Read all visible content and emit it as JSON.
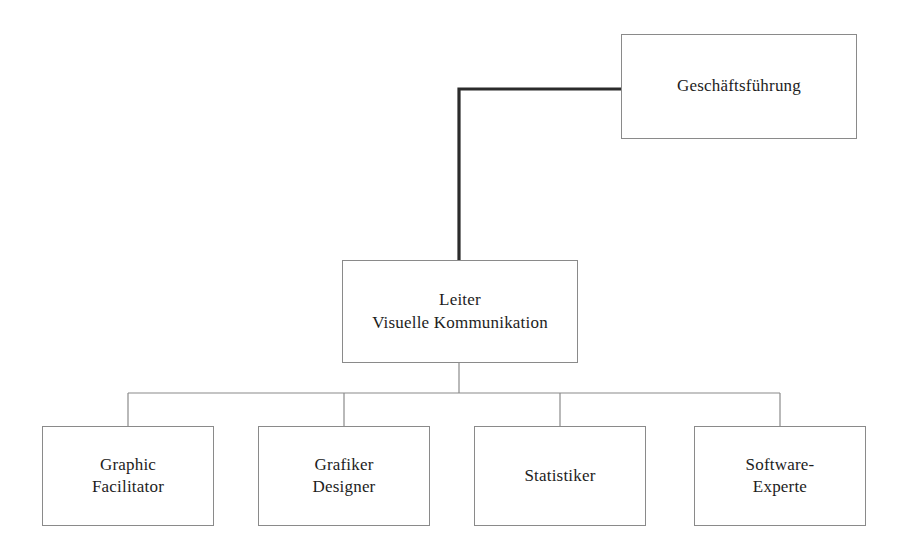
{
  "diagram": {
    "background_color": "#ffffff",
    "box_border_color": "#8a8a8a",
    "text_color": "#1d1d1d",
    "primary_edge_color": "#2b2b2b",
    "secondary_edge_color": "#8a8a8a",
    "nodes": {
      "executive": {
        "label": "Geschäftsführung",
        "level": 1
      },
      "head": {
        "label": "Leiter\nVisuelle Kommunikation",
        "line1": "Leiter",
        "line2": "Visuelle Kommunikation",
        "level": 2
      },
      "reports": [
        {
          "label": "Graphic\nFacilitator",
          "line1": "Graphic",
          "line2": "Facilitator"
        },
        {
          "label": "Grafiker\nDesigner",
          "line1": "Grafiker",
          "line2": "Designer"
        },
        {
          "label": "Statistiker",
          "line1": "Statistiker",
          "line2": ""
        },
        {
          "label": "Software-\nExperte",
          "line1": "Software-",
          "line2": "Experte"
        }
      ]
    }
  }
}
